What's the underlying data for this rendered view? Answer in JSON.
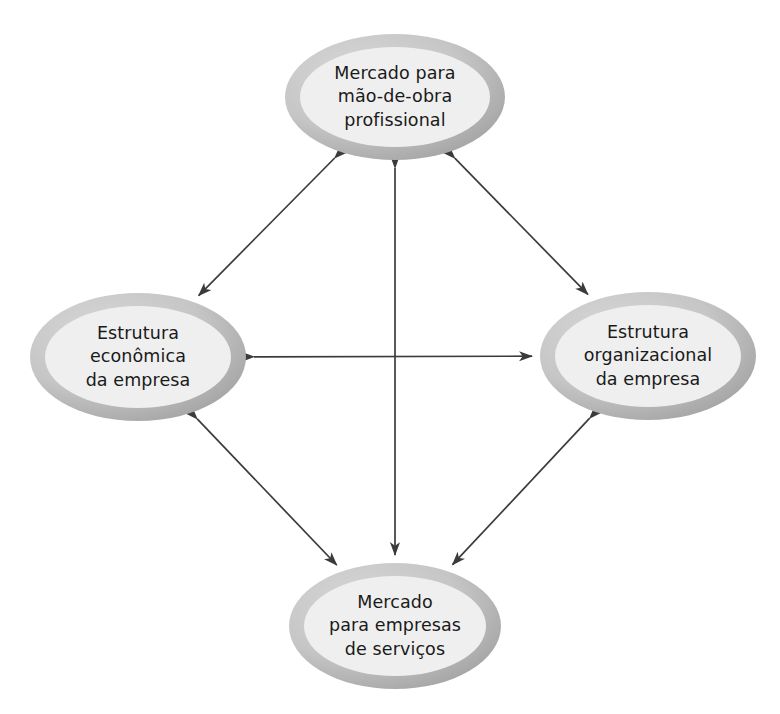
{
  "diagram": {
    "type": "relationship-diagram",
    "title": "",
    "background_color": "#ffffff",
    "text_color": "#1a1a1a",
    "arrow_color": "#3b3b3b",
    "node_ring_color_light": "#cfcfcf",
    "node_ring_color_dark": "#a5a5a5",
    "node_fill_color": "#efefef",
    "nodes": [
      {
        "id": "top",
        "name": "mercado-mao-de-obra",
        "cx": 395,
        "cy": 97,
        "rx": 110,
        "ry": 63,
        "lines": [
          "Mercado para",
          "mão-de-obra",
          "profissional"
        ]
      },
      {
        "id": "left",
        "name": "estrutura-economica",
        "cx": 138,
        "cy": 357,
        "rx": 108,
        "ry": 64,
        "lines": [
          "Estrutura",
          "econômica",
          "da empresa"
        ]
      },
      {
        "id": "right",
        "name": "estrutura-organizacional",
        "cx": 648,
        "cy": 356,
        "rx": 108,
        "ry": 64,
        "lines": [
          "Estrutura",
          "organizacional",
          "da empresa"
        ]
      },
      {
        "id": "bottom",
        "name": "mercado-empresas-servicos",
        "cx": 395,
        "cy": 626,
        "rx": 106,
        "ry": 63,
        "lines": [
          "Mercado",
          "para empresas",
          "de serviços"
        ]
      }
    ],
    "connections": [
      {
        "name": "top-left-connector",
        "from": "top",
        "to": "left",
        "style": "double-arrow",
        "orientation": "diagonal"
      },
      {
        "name": "top-right-connector",
        "from": "top",
        "to": "right",
        "style": "double-arrow",
        "orientation": "diagonal"
      },
      {
        "name": "left-bottom-connector",
        "from": "left",
        "to": "bottom",
        "style": "double-arrow",
        "orientation": "diagonal"
      },
      {
        "name": "right-bottom-connector",
        "from": "right",
        "to": "bottom",
        "style": "double-arrow",
        "orientation": "diagonal"
      },
      {
        "name": "left-right-connector",
        "from": "left",
        "to": "right",
        "style": "double-arrow",
        "orientation": "horizontal"
      },
      {
        "name": "top-bottom-connector",
        "from": "top",
        "to": "bottom",
        "style": "double-arrow",
        "orientation": "vertical"
      }
    ]
  }
}
